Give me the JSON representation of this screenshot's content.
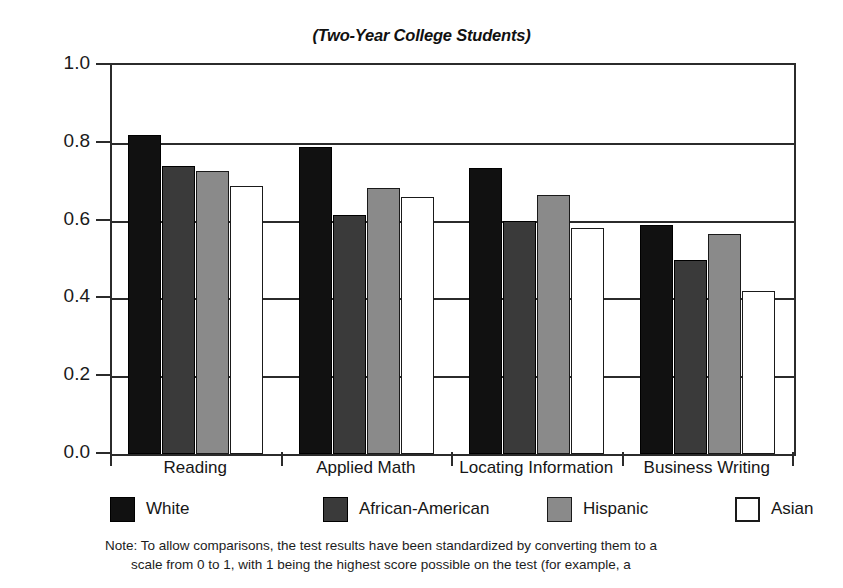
{
  "chart_data": {
    "type": "bar",
    "title": "(Two-Year College Students)",
    "xlabel": "",
    "ylabel": "",
    "ylim": [
      0.0,
      1.0
    ],
    "ytick_labels": [
      "1.0",
      "0.8",
      "0.6",
      "0.4",
      "0.2",
      "0.0"
    ],
    "ytick_values": [
      1.0,
      0.8,
      0.6,
      0.4,
      0.2,
      0.0
    ],
    "grid": true,
    "legend_position": "bottom",
    "categories": [
      "Reading",
      "Applied Math",
      "Locating Information",
      "Business Writing"
    ],
    "series": [
      {
        "name": "White",
        "values": [
          0.82,
          0.79,
          0.735,
          0.59
        ]
      },
      {
        "name": "African-American",
        "values": [
          0.74,
          0.615,
          0.6,
          0.5
        ]
      },
      {
        "name": "Hispanic",
        "values": [
          0.728,
          0.683,
          0.665,
          0.565
        ]
      },
      {
        "name": "Asian",
        "values": [
          0.69,
          0.66,
          0.58,
          0.42
        ]
      }
    ],
    "colors": {
      "White": "#111111",
      "African-American": "#3a3a3a",
      "Hispanic": "#8a8a8a",
      "Asian": "#ffffff"
    },
    "annotations": {
      "note_line_1": "Note: To allow comparisons, the test results have been standardized by converting them to a",
      "note_line_2": "scale from 0 to 1, with 1 being the highest score possible on the test (for example, a"
    }
  }
}
